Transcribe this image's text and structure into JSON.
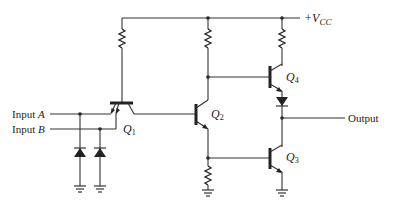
{
  "diagram": {
    "type": "circuit-schematic",
    "supply": {
      "label_prefix": "+V",
      "label_sub": "CC"
    },
    "inputs": [
      {
        "label": "Input",
        "var": "A"
      },
      {
        "label": "Input",
        "var": "B"
      }
    ],
    "output": {
      "label": "Output"
    },
    "transistors": [
      {
        "id": "Q1",
        "letter": "Q",
        "sub": "1",
        "kind": "multi-emitter NPN"
      },
      {
        "id": "Q2",
        "letter": "Q",
        "sub": "2",
        "kind": "NPN"
      },
      {
        "id": "Q3",
        "letter": "Q",
        "sub": "3",
        "kind": "NPN"
      },
      {
        "id": "Q4",
        "letter": "Q",
        "sub": "4",
        "kind": "NPN"
      }
    ],
    "components": {
      "resistors": 4,
      "clamp_diodes": 2,
      "output_diode": 1,
      "grounds": 4
    },
    "colors": {
      "line": "#333333",
      "background": "#ffffff"
    }
  }
}
